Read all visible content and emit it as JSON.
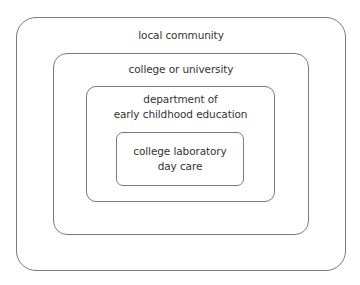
{
  "diagram": {
    "type": "nested-boxes",
    "levels": [
      {
        "label_lines": [
          "local community"
        ]
      },
      {
        "label_lines": [
          "college or university"
        ]
      },
      {
        "label_lines": [
          "department of",
          "early childhood education"
        ]
      },
      {
        "label_lines": [
          "college laboratory",
          "day care"
        ]
      }
    ],
    "colors": {
      "border": "#7a7a7a",
      "text": "#333333",
      "background": "#ffffff"
    }
  }
}
